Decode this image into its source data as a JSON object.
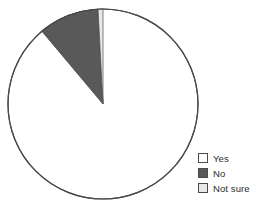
{
  "chart_data": {
    "type": "pie",
    "title": "",
    "subtitle": "",
    "xlabel": "",
    "ylabel": "",
    "grid": false,
    "legend_position": "bottom-right",
    "start_angle_deg": 90,
    "direction": "counterclockwise",
    "categories": [
      "Yes",
      "No",
      "Not sure"
    ],
    "values": [
      89,
      10,
      1
    ],
    "value_unit": "percent",
    "slices": [
      {
        "label": "Yes",
        "value": 89,
        "color": "#ffffff",
        "edge_color": "#4a4a4a",
        "start_angle_deg": 130,
        "end_angle_deg": 450,
        "sweep_deg": 320
      },
      {
        "label": "No",
        "value": 10,
        "color": "#595959",
        "edge_color": "#4a4a4a",
        "start_angle_deg": 93,
        "end_angle_deg": 130,
        "sweep_deg": 37
      },
      {
        "label": "Not sure",
        "value": 1,
        "color": "#e8e8e8",
        "edge_color": "#4a4a4a",
        "start_angle_deg": 90,
        "end_angle_deg": 93,
        "sweep_deg": 3
      }
    ],
    "geometry": {
      "center_x": 103,
      "center_y": 104,
      "radius": 95
    }
  },
  "legend": {
    "items": [
      {
        "label": "Yes",
        "swatch_color": "#ffffff"
      },
      {
        "label": "No",
        "swatch_color": "#595959"
      },
      {
        "label": "Not sure",
        "swatch_color": "#e8e8e8"
      }
    ]
  },
  "colors": {
    "background": "#ffffff",
    "outline": "#4a4a4a",
    "text": "#2b2b2b",
    "slice_yes": "#ffffff",
    "slice_no": "#595959",
    "slice_not_sure": "#e8e8e8"
  }
}
